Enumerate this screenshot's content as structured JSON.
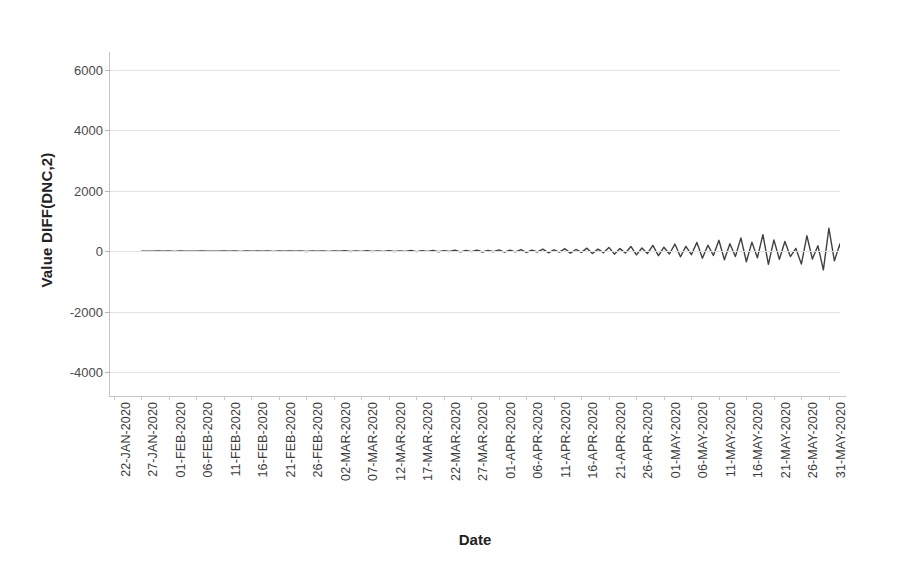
{
  "chart_data": {
    "type": "line",
    "title": "",
    "xlabel": "Date",
    "ylabel": "Value DIFF(DNC,2)",
    "ylim": [
      -4800,
      6600
    ],
    "yticks": [
      6000,
      4000,
      2000,
      0,
      -2000,
      -4000
    ],
    "ytick_labels": [
      "6000",
      "4000",
      "2000",
      "0",
      "-2000",
      "-4000"
    ],
    "grid": true,
    "legend": false,
    "line_color": "#404040",
    "line_width": 1.4,
    "x_start": "22-JAN-2020",
    "x_end": "31-MAY-2020",
    "x_tick_step_days": 5,
    "xtick_labels": [
      "22-JAN-2020",
      "27-JAN-2020",
      "01-FEB-2020",
      "06-FEB-2020",
      "11-FEB-2020",
      "16-FEB-2020",
      "21-FEB-2020",
      "26-FEB-2020",
      "02-MAR-2020",
      "07-MAR-2020",
      "12-MAR-2020",
      "17-MAR-2020",
      "22-MAR-2020",
      "27-MAR-2020",
      "01-APR-2020",
      "06-APR-2020",
      "11-APR-2020",
      "16-APR-2020",
      "21-APR-2020",
      "26-APR-2020",
      "01-MAY-2020",
      "06-MAY-2020",
      "11-MAY-2020",
      "16-MAY-2020",
      "21-MAY-2020",
      "26-MAY-2020",
      "31-MAY-2020"
    ],
    "x_index_start": 5,
    "values": [
      -4,
      2,
      -3,
      5,
      -2,
      3,
      -6,
      4,
      -1,
      2,
      -5,
      6,
      -3,
      1,
      -4,
      5,
      -2,
      3,
      -7,
      6,
      -3,
      4,
      -2,
      8,
      -6,
      5,
      -3,
      7,
      -4,
      6,
      -9,
      8,
      -5,
      10,
      -7,
      9,
      -4,
      12,
      -10,
      8,
      -6,
      14,
      -11,
      9,
      -7,
      16,
      -13,
      11,
      -8,
      20,
      -16,
      14,
      -9,
      24,
      -19,
      17,
      -12,
      30,
      -24,
      21,
      -15,
      36,
      -29,
      25,
      -18,
      44,
      -35,
      30,
      -22,
      54,
      -43,
      37,
      -27,
      66,
      -53,
      45,
      -33,
      82,
      -66,
      56,
      -41,
      100,
      -80,
      68,
      -50,
      125,
      -100,
      85,
      -62,
      155,
      -124,
      106,
      -78,
      190,
      -152,
      130,
      -95,
      235,
      -188,
      160,
      -117,
      290,
      -232,
      198,
      -145,
      360,
      -288,
      245,
      -180,
      440,
      -352,
      300,
      -220,
      545,
      -436,
      372,
      -272,
      320,
      -180,
      90,
      -430,
      510,
      -260,
      180,
      -620,
      760,
      -320,
      240,
      -810,
      520,
      -150,
      995,
      -640,
      430,
      -1180,
      1430,
      -480,
      360,
      -1530,
      980,
      -260,
      1880,
      -1180,
      560,
      -3570,
      1960,
      980,
      -1340,
      1390,
      -1950,
      620,
      1560,
      -860,
      420,
      -3350,
      2420,
      -1120,
      1540,
      -2620,
      1180,
      440,
      2080,
      -1260,
      690,
      -2520,
      2900,
      -960,
      1260,
      -2470,
      1420,
      360,
      2120,
      -1180,
      780,
      -2430,
      1680,
      620,
      900,
      -2510,
      1940,
      -760,
      1120,
      -1520,
      840,
      -560,
      1060,
      -1380,
      640,
      -1820,
      900,
      -420,
      1140,
      -1520,
      560,
      -1970,
      4560,
      -1120,
      -2320,
      860,
      -1240,
      -380,
      420,
      -1460,
      -320
    ]
  }
}
